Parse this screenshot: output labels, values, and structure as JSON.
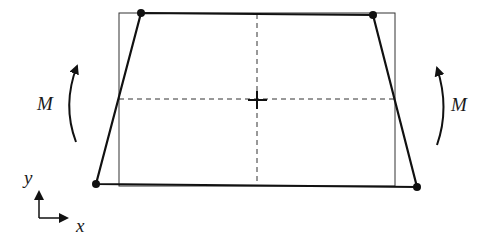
{
  "diagram": {
    "colors": {
      "stroke": "#111111",
      "thin": "#333333",
      "background": "#ffffff"
    },
    "labels": {
      "moment_left": "M",
      "moment_right": "M",
      "axis_x": "x",
      "axis_y": "y"
    },
    "original_rectangle": {
      "x1": 119,
      "y1": 13,
      "x2": 395,
      "y2": 186
    },
    "deformed_shape": {
      "points": [
        [
          141,
          13
        ],
        [
          373,
          15
        ],
        [
          417,
          187
        ],
        [
          96,
          184
        ]
      ],
      "nodes": [
        "top-left",
        "top-right",
        "bottom-right",
        "bottom-left"
      ]
    },
    "centerlines": {
      "vertical": {
        "x": 257,
        "y1": 14,
        "y2": 185
      },
      "horizontal": {
        "y": 99,
        "x1": 119,
        "x2": 395
      }
    },
    "centroid": {
      "x": 257,
      "y": 100
    },
    "moments": [
      {
        "side": "left",
        "direction": "counterclockwise-up"
      },
      {
        "side": "right",
        "direction": "clockwise-up"
      }
    ],
    "axes_origin": {
      "x": 39,
      "y": 218
    }
  }
}
